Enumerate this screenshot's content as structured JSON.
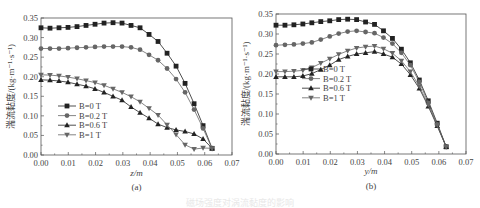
{
  "figure_caption": "磁场强度对涡流黏度的影响",
  "chart_data": [
    {
      "type": "line",
      "panel_label": "(a)",
      "title": "",
      "xlabel": "z/m",
      "ylabel": "湍流黏度/(kg·m⁻¹·s⁻¹)",
      "xlim": [
        0.0,
        0.07
      ],
      "ylim": [
        0.0,
        0.35
      ],
      "xticks": [
        "0.00",
        "0.01",
        "0.02",
        "0.03",
        "0.04",
        "0.05",
        "0.06",
        "0.07"
      ],
      "yticks": [
        "0.00",
        "0.05",
        "0.10",
        "0.15",
        "0.20",
        "0.25",
        "0.30",
        "0.35"
      ],
      "grid": false,
      "legend_position": "center-left",
      "x": [
        0.0,
        0.0033,
        0.0066,
        0.0099,
        0.0132,
        0.0165,
        0.0198,
        0.0231,
        0.0264,
        0.0297,
        0.033,
        0.0363,
        0.0396,
        0.0429,
        0.0462,
        0.0495,
        0.0528,
        0.0561,
        0.0594,
        0.0627
      ],
      "series": [
        {
          "name": "B=0 T",
          "marker": "square",
          "values": [
            0.325,
            0.324,
            0.325,
            0.326,
            0.328,
            0.331,
            0.334,
            0.337,
            0.338,
            0.337,
            0.331,
            0.325,
            0.308,
            0.29,
            0.26,
            0.227,
            0.183,
            0.131,
            0.075,
            0.017
          ]
        },
        {
          "name": "B=0.2 T",
          "marker": "circle",
          "values": [
            0.272,
            0.272,
            0.272,
            0.273,
            0.274,
            0.275,
            0.276,
            0.277,
            0.277,
            0.277,
            0.275,
            0.269,
            0.256,
            0.242,
            0.221,
            0.194,
            0.16,
            0.116,
            0.068,
            0.016
          ]
        },
        {
          "name": "B=0.6 T",
          "marker": "triangle-up",
          "values": [
            0.192,
            0.191,
            0.189,
            0.186,
            0.181,
            0.176,
            0.169,
            0.16,
            0.15,
            0.14,
            0.123,
            0.108,
            0.094,
            0.079,
            0.07,
            0.064,
            0.06,
            0.054,
            0.041,
            0.017
          ]
        },
        {
          "name": "B=1 T",
          "marker": "triangle-down",
          "values": [
            0.205,
            0.204,
            0.202,
            0.199,
            0.195,
            0.19,
            0.185,
            0.178,
            0.169,
            0.16,
            0.149,
            0.136,
            0.119,
            0.102,
            0.077,
            0.052,
            0.026,
            0.015,
            0.018,
            0.017
          ]
        }
      ]
    },
    {
      "type": "line",
      "panel_label": "(b)",
      "title": "",
      "xlabel": "y/m",
      "ylabel": "湍流黏度/(kg·m⁻¹·s⁻¹)",
      "xlim": [
        0.0,
        0.07
      ],
      "ylim": [
        0.0,
        0.35
      ],
      "xticks": [
        "0.00",
        "0.01",
        "0.02",
        "0.03",
        "0.04",
        "0.05",
        "0.06",
        "0.07"
      ],
      "yticks": [
        "0.00",
        "0.05",
        "0.10",
        "0.15",
        "0.20",
        "0.25",
        "0.30",
        "0.35"
      ],
      "grid": false,
      "legend_position": "center-left",
      "x": [
        0.0,
        0.0033,
        0.0066,
        0.0099,
        0.0132,
        0.0165,
        0.0198,
        0.0231,
        0.0264,
        0.0297,
        0.033,
        0.0363,
        0.0396,
        0.0429,
        0.0462,
        0.0495,
        0.0528,
        0.0561,
        0.0594,
        0.0627
      ],
      "series": [
        {
          "name": "B=0 T",
          "marker": "square",
          "values": [
            0.322,
            0.322,
            0.323,
            0.325,
            0.328,
            0.331,
            0.333,
            0.336,
            0.337,
            0.336,
            0.33,
            0.324,
            0.308,
            0.289,
            0.262,
            0.228,
            0.185,
            0.133,
            0.077,
            0.018
          ]
        },
        {
          "name": "B=0.2 T",
          "marker": "circle",
          "values": [
            0.272,
            0.273,
            0.274,
            0.276,
            0.279,
            0.286,
            0.294,
            0.301,
            0.306,
            0.308,
            0.305,
            0.302,
            0.291,
            0.276,
            0.253,
            0.222,
            0.18,
            0.128,
            0.074,
            0.018
          ]
        },
        {
          "name": "B=0.6 T",
          "marker": "triangle-up",
          "values": [
            0.193,
            0.193,
            0.193,
            0.195,
            0.201,
            0.211,
            0.222,
            0.236,
            0.244,
            0.25,
            0.253,
            0.256,
            0.25,
            0.242,
            0.225,
            0.198,
            0.164,
            0.119,
            0.07,
            0.018
          ]
        },
        {
          "name": "B=1 T",
          "marker": "triangle-down",
          "values": [
            0.206,
            0.206,
            0.207,
            0.209,
            0.216,
            0.227,
            0.238,
            0.249,
            0.258,
            0.265,
            0.268,
            0.27,
            0.263,
            0.252,
            0.233,
            0.206,
            0.169,
            0.123,
            0.072,
            0.018
          ]
        }
      ]
    }
  ]
}
